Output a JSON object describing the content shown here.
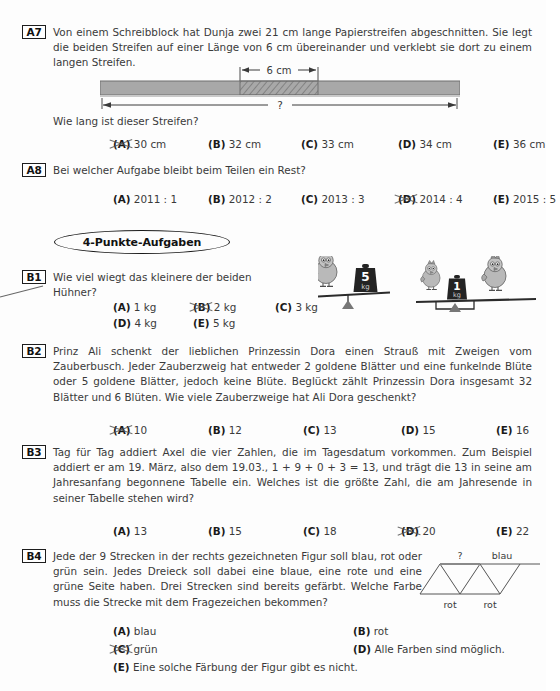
{
  "page": {
    "section_banner": "4-Punkte-Aufgaben",
    "background": "#fdfdfd",
    "ink": "#3a3a3a",
    "strip_fill": "#a8a8a8",
    "strip_border": "#6b6b6b",
    "mark_color": "#555555"
  },
  "problems": [
    {
      "id": "A7",
      "tag": "A7",
      "text": "Von einem Schreibblock hat Dunja zwei 21 cm lange Papierstreifen abgeschnitten. Sie legt die beiden Streifen auf einer Länge von 6 cm übereinander und verklebt sie dort zu einem langen Streifen.",
      "question": "Wie lang ist dieser Streifen?",
      "figure": {
        "type": "paper-strip",
        "overlap_label": "6 cm",
        "total_label": "?"
      },
      "options": [
        {
          "label": "A",
          "text": "30 cm",
          "marked": true
        },
        {
          "label": "B",
          "text": "32 cm",
          "marked": false
        },
        {
          "label": "C",
          "text": "33 cm",
          "marked": false
        },
        {
          "label": "D",
          "text": "34 cm",
          "marked": false
        },
        {
          "label": "E",
          "text": "36 cm",
          "marked": false
        }
      ]
    },
    {
      "id": "A8",
      "tag": "A8",
      "text": "Bei welcher Aufgabe bleibt beim Teilen ein Rest?",
      "options": [
        {
          "label": "A",
          "text": "2011 : 1",
          "marked": false
        },
        {
          "label": "B",
          "text": "2012 : 2",
          "marked": false
        },
        {
          "label": "C",
          "text": "2013 : 3",
          "marked": false
        },
        {
          "label": "D",
          "text": "2014 : 4",
          "marked": true
        },
        {
          "label": "E",
          "text": "2015 : 5",
          "marked": false
        }
      ]
    },
    {
      "id": "B1",
      "tag": "B1",
      "text": "Wie viel wiegt das kleinere der beiden Hühner?",
      "figure": {
        "type": "seesaw-balances",
        "left_weight_label": "5",
        "left_weight_unit": "kg",
        "right_weight_label": "1",
        "right_weight_unit": "kg"
      },
      "options": [
        {
          "label": "A",
          "text": "1 kg",
          "marked": false
        },
        {
          "label": "B",
          "text": "2 kg",
          "marked": true
        },
        {
          "label": "C",
          "text": "3 kg",
          "marked": false
        },
        {
          "label": "D",
          "text": "4 kg",
          "marked": false
        },
        {
          "label": "E",
          "text": "5 kg",
          "marked": false
        }
      ]
    },
    {
      "id": "B2",
      "tag": "B2",
      "text": "Prinz Ali schenkt der lieblichen Prinzessin Dora einen Strauß mit Zweigen vom Zauberbusch. Jeder Zauberzweig hat entweder 2 goldene Blätter und eine funkelnde Blüte oder 5 goldene Blätter, jedoch keine Blüte. Beglückt zählt Prinzessin Dora insgesamt 32 Blätter und 6 Blüten. Wie viele Zauberzweige hat Ali Dora geschenkt?",
      "options": [
        {
          "label": "A",
          "text": "10",
          "marked": true
        },
        {
          "label": "B",
          "text": "12",
          "marked": false
        },
        {
          "label": "C",
          "text": "13",
          "marked": false
        },
        {
          "label": "D",
          "text": "15",
          "marked": false
        },
        {
          "label": "E",
          "text": "16",
          "marked": false
        }
      ]
    },
    {
      "id": "B3",
      "tag": "B3",
      "text": "Tag für Tag addiert Axel die vier Zahlen, die im Tagesdatum vorkommen. Zum Beispiel addiert er am 19. März, also dem 19.03., 1 + 9 + 0 + 3 = 13, und trägt die 13 in seine am Jahresanfang begonnene Tabelle ein. Welches ist die größte Zahl, die am Jahresende in seiner Tabelle stehen wird?",
      "options": [
        {
          "label": "A",
          "text": "13",
          "marked": false
        },
        {
          "label": "B",
          "text": "15",
          "marked": false
        },
        {
          "label": "C",
          "text": "18",
          "marked": false
        },
        {
          "label": "D",
          "text": "20",
          "marked": true
        },
        {
          "label": "E",
          "text": "22",
          "marked": false
        }
      ]
    },
    {
      "id": "B4",
      "tag": "B4",
      "text": "Jede der 9 Strecken in der rechts gezeichneten Figur soll blau, rot oder grün sein. Jedes Dreieck soll dabei eine blaue, eine rote und eine grüne Seite haben. Drei Strecken sind bereits gefärbt. Welche Farbe muss die Strecke mit dem Fragezeichen bekommen?",
      "figure": {
        "type": "triangle-strip",
        "label_question": "?",
        "label_top_right": "blau",
        "label_bottom_left": "rot",
        "label_bottom_right": "rot"
      },
      "options": [
        {
          "label": "A",
          "text": "blau",
          "marked": false
        },
        {
          "label": "B",
          "text": "rot",
          "marked": false
        },
        {
          "label": "C",
          "text": "grün",
          "marked": true
        },
        {
          "label": "D",
          "text": "Alle Farben sind möglich.",
          "marked": false
        },
        {
          "label": "E",
          "text": "Eine solche Färbung der Figur gibt es nicht.",
          "marked": false
        }
      ]
    }
  ]
}
